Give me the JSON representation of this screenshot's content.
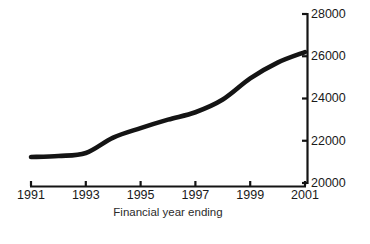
{
  "chart_data": {
    "type": "line",
    "title": "",
    "xlabel": "Financial year ending",
    "ylabel": "",
    "x": [
      1991,
      1992,
      1993,
      1994,
      1995,
      1996,
      1997,
      1998,
      1999,
      2000,
      2001
    ],
    "values": [
      21230,
      21280,
      21420,
      22150,
      22600,
      23000,
      23350,
      23950,
      24950,
      25700,
      26200
    ],
    "series": [
      {
        "name": "Financial year ending series",
        "values": [
          21230,
          21280,
          21420,
          22150,
          22600,
          23000,
          23350,
          23950,
          24950,
          25700,
          26200
        ]
      }
    ],
    "xticks": [
      1991,
      1993,
      1995,
      1997,
      1999,
      2001
    ],
    "xtick_labels": [
      "1991",
      "1993",
      "1995",
      "1997",
      "1999",
      "2001"
    ],
    "yticks": [
      20000,
      22000,
      24000,
      26000,
      28000
    ],
    "ytick_labels": [
      "20000",
      "22000",
      "24000",
      "26000",
      "28000"
    ],
    "xlim": [
      1991,
      2001
    ],
    "ylim": [
      20000,
      28000
    ],
    "grid": false,
    "legend": false,
    "legend_position": "none",
    "y_axis_side": "right",
    "line_color": "#141414",
    "background_color": "#ffffff"
  },
  "figure": {
    "width": 370,
    "height": 244,
    "plot_left": 31,
    "plot_right": 305,
    "axis_x": 307,
    "axis_top_y": 14,
    "axis_bottom_y": 183,
    "xaxis_y": 186,
    "xlabel_y": 216,
    "xtick_label_y": 190,
    "tick_length": 5
  }
}
